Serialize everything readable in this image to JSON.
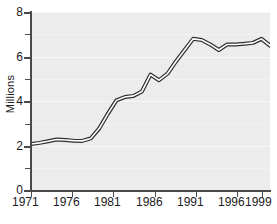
{
  "chart_data": {
    "type": "line",
    "title": "",
    "subtitle": "",
    "xlabel": "",
    "ylabel": "Millions",
    "xlim": [
      1971,
      1999
    ],
    "ylim": [
      0,
      8
    ],
    "grid": true,
    "legend": null,
    "y_ticks_major": [
      "0",
      "2",
      "4",
      "6",
      "8"
    ],
    "y_tick_values_major": [
      0,
      2,
      4,
      6,
      8
    ],
    "y_tick_values_minor": [
      1,
      3,
      5,
      7
    ],
    "x_tick_labels": [
      "1971",
      "1976",
      "1981",
      "1986",
      "1991",
      "1996",
      "1999"
    ],
    "x_tick_values": [
      1971,
      1976,
      1981,
      1986,
      1991,
      1996,
      1999
    ],
    "line_style": "outlined-double-line",
    "line_color": "#2e2e2e",
    "line_fill_color": "#ffffff",
    "plot_background": "#ececec",
    "series": [
      {
        "name": "Millions",
        "x": [
          1971,
          1972,
          1973,
          1974,
          1975,
          1976,
          1977,
          1978,
          1979,
          1980,
          1981,
          1982,
          1983,
          1984,
          1985,
          1986,
          1987,
          1988,
          1989,
          1990,
          1991,
          1992,
          1993,
          1994,
          1995,
          1996,
          1997,
          1998,
          1999
        ],
        "values": [
          2.1,
          2.15,
          2.22,
          2.3,
          2.28,
          2.25,
          2.24,
          2.35,
          2.8,
          3.45,
          4.05,
          4.2,
          4.25,
          4.45,
          5.2,
          4.95,
          5.25,
          5.8,
          6.3,
          6.8,
          6.75,
          6.55,
          6.3,
          6.55,
          6.55,
          6.58,
          6.62,
          6.8,
          6.5
        ]
      }
    ]
  },
  "axis": {
    "y_title": "Millions"
  }
}
